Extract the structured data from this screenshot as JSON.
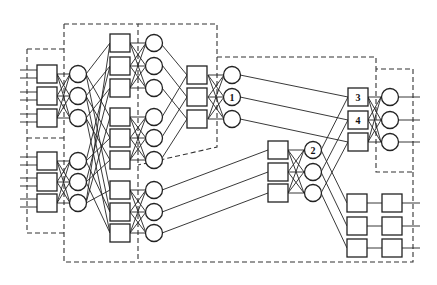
{
  "diagram": {
    "title": "",
    "colors": {
      "stroke": "#222222",
      "background": "#ffffff",
      "dash": "#333333"
    },
    "labels": {
      "circle_1": "1",
      "circle_2": "2",
      "square_3": "3",
      "square_4": "4"
    },
    "stages": [
      {
        "name": "input-stage",
        "groups": 2,
        "switches_per_group": 3,
        "type": "square+circle"
      },
      {
        "name": "second-stage",
        "groups": 3,
        "switches_per_group": 3,
        "type": "square+circle"
      },
      {
        "name": "third-stage-upper",
        "groups": 1,
        "switches_per_group": 3,
        "type": "square+circle",
        "marked_circle": "1"
      },
      {
        "name": "third-stage-middle",
        "groups": 1,
        "switches_per_group": 3,
        "type": "square+circle",
        "marked_circle": "2"
      },
      {
        "name": "output-stage-upper",
        "groups": 1,
        "switches_per_group": 3,
        "type": "square+circle",
        "marked_squares": [
          "3",
          "4"
        ]
      },
      {
        "name": "output-stage-lower",
        "groups": 1,
        "switches_per_group": 3,
        "type": "square+square"
      }
    ]
  }
}
